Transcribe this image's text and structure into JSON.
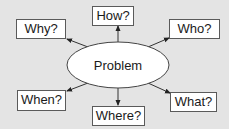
{
  "diagram": {
    "type": "mind-map",
    "center": {
      "label": "Problem"
    },
    "nodes": [
      {
        "id": "how",
        "label": "How?"
      },
      {
        "id": "why",
        "label": "Why?"
      },
      {
        "id": "who",
        "label": "Who?"
      },
      {
        "id": "when",
        "label": "When?"
      },
      {
        "id": "where",
        "label": "Where?"
      },
      {
        "id": "what",
        "label": "What?"
      }
    ],
    "edges": [
      {
        "from": "Problem",
        "to": "How?"
      },
      {
        "from": "Problem",
        "to": "Why?"
      },
      {
        "from": "Problem",
        "to": "Who?"
      },
      {
        "from": "Problem",
        "to": "When?"
      },
      {
        "from": "Problem",
        "to": "Where?"
      },
      {
        "from": "Problem",
        "to": "What?"
      }
    ],
    "colors": {
      "background": "#e4e4e4",
      "box_fill": "#ffffff",
      "stroke": "#333333"
    }
  }
}
